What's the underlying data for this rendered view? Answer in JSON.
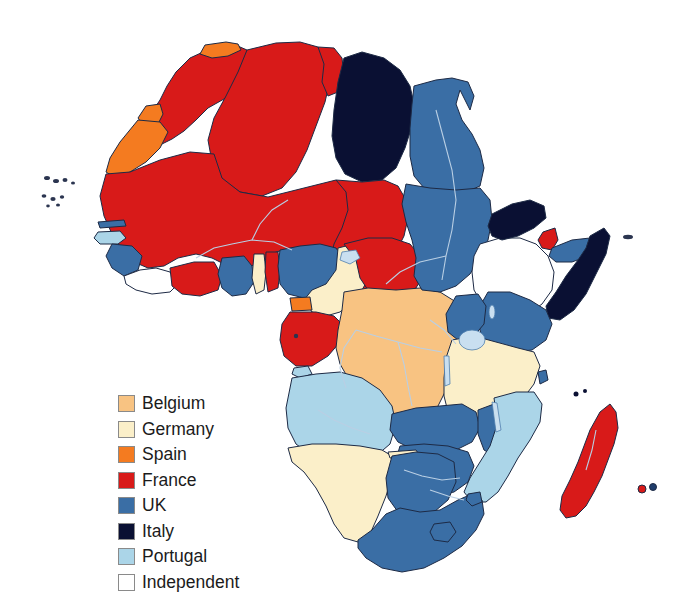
{
  "map": {
    "title": "Colonial Africa",
    "background_color": "#ffffff",
    "border_color": "#1d2a45",
    "river_color": "#b9cfe4",
    "legend": {
      "position": "lower-left",
      "items": [
        {
          "label": "Belgium",
          "color": "#f8c382",
          "swatch_border": "#8a8a8a"
        },
        {
          "label": "Germany",
          "color": "#fbefc9",
          "swatch_border": "#8a8a8a"
        },
        {
          "label": "Spain",
          "color": "#f47b20",
          "swatch_border": "#8a8a8a"
        },
        {
          "label": "France",
          "color": "#d81a19",
          "swatch_border": "#8a8a8a"
        },
        {
          "label": "UK",
          "color": "#3a6ea5",
          "swatch_border": "#8a8a8a"
        },
        {
          "label": "Italy",
          "color": "#0a1033",
          "swatch_border": "#8a8a8a"
        },
        {
          "label": "Portugal",
          "color": "#abd5e8",
          "swatch_border": "#8a8a8a"
        },
        {
          "label": "Independent",
          "color": "#ffffff",
          "swatch_border": "#8a8a8a"
        }
      ]
    },
    "regions": [
      {
        "name": "Morocco",
        "power": "France",
        "color": "#d81a19"
      },
      {
        "name": "Spanish Morocco",
        "power": "Spain",
        "color": "#f47b20"
      },
      {
        "name": "Ifni",
        "power": "Spain",
        "color": "#f47b20"
      },
      {
        "name": "Rio de Oro (Spanish Sahara)",
        "power": "Spain",
        "color": "#f47b20"
      },
      {
        "name": "Algeria",
        "power": "France",
        "color": "#d81a19"
      },
      {
        "name": "Tunisia",
        "power": "France",
        "color": "#d81a19"
      },
      {
        "name": "Libya",
        "power": "Italy",
        "color": "#0a1033"
      },
      {
        "name": "Egypt",
        "power": "UK",
        "color": "#3a6ea5"
      },
      {
        "name": "Anglo-Egyptian Sudan",
        "power": "UK",
        "color": "#3a6ea5"
      },
      {
        "name": "French West Africa",
        "power": "France",
        "color": "#d81a19"
      },
      {
        "name": "Mauritania",
        "power": "France",
        "color": "#d81a19"
      },
      {
        "name": "Senegal",
        "power": "France",
        "color": "#d81a19"
      },
      {
        "name": "Gambia",
        "power": "UK",
        "color": "#3a6ea5"
      },
      {
        "name": "Portuguese Guinea",
        "power": "Portugal",
        "color": "#abd5e8"
      },
      {
        "name": "Sierra Leone",
        "power": "UK",
        "color": "#3a6ea5"
      },
      {
        "name": "Liberia",
        "power": "Independent",
        "color": "#ffffff"
      },
      {
        "name": "Ivory Coast",
        "power": "France",
        "color": "#d81a19"
      },
      {
        "name": "Gold Coast",
        "power": "UK",
        "color": "#3a6ea5"
      },
      {
        "name": "Togoland",
        "power": "Germany",
        "color": "#fbefc9"
      },
      {
        "name": "Dahomey",
        "power": "France",
        "color": "#d81a19"
      },
      {
        "name": "Nigeria",
        "power": "UK",
        "color": "#3a6ea5"
      },
      {
        "name": "Kamerun",
        "power": "Germany",
        "color": "#fbefc9"
      },
      {
        "name": "Rio Muni (Spanish Guinea)",
        "power": "Spain",
        "color": "#f47b20"
      },
      {
        "name": "French Equatorial Africa",
        "power": "France",
        "color": "#d81a19"
      },
      {
        "name": "Gabon",
        "power": "France",
        "color": "#d81a19"
      },
      {
        "name": "Chad",
        "power": "France",
        "color": "#d81a19"
      },
      {
        "name": "Belgian Congo",
        "power": "Belgium",
        "color": "#f8c382"
      },
      {
        "name": "Cabinda",
        "power": "Portugal",
        "color": "#abd5e8"
      },
      {
        "name": "Angola",
        "power": "Portugal",
        "color": "#abd5e8"
      },
      {
        "name": "German South-West Africa",
        "power": "Germany",
        "color": "#fbefc9"
      },
      {
        "name": "Bechuanaland",
        "power": "UK",
        "color": "#3a6ea5"
      },
      {
        "name": "Union of South Africa",
        "power": "UK",
        "color": "#3a6ea5"
      },
      {
        "name": "Basutoland",
        "power": "UK",
        "color": "#3a6ea5"
      },
      {
        "name": "Swaziland",
        "power": "UK",
        "color": "#3a6ea5"
      },
      {
        "name": "Southern Rhodesia",
        "power": "UK",
        "color": "#3a6ea5"
      },
      {
        "name": "Northern Rhodesia",
        "power": "UK",
        "color": "#3a6ea5"
      },
      {
        "name": "Nyasaland",
        "power": "UK",
        "color": "#3a6ea5"
      },
      {
        "name": "Mozambique",
        "power": "Portugal",
        "color": "#abd5e8"
      },
      {
        "name": "German East Africa",
        "power": "Germany",
        "color": "#fbefc9"
      },
      {
        "name": "British East Africa",
        "power": "UK",
        "color": "#3a6ea5"
      },
      {
        "name": "Uganda",
        "power": "UK",
        "color": "#3a6ea5"
      },
      {
        "name": "Abyssinia (Ethiopia)",
        "power": "Independent",
        "color": "#ffffff"
      },
      {
        "name": "Eritrea",
        "power": "Italy",
        "color": "#0a1033"
      },
      {
        "name": "French Somaliland",
        "power": "France",
        "color": "#d81a19"
      },
      {
        "name": "British Somaliland",
        "power": "UK",
        "color": "#3a6ea5"
      },
      {
        "name": "Italian Somaliland",
        "power": "Italy",
        "color": "#0a1033"
      },
      {
        "name": "Madagascar",
        "power": "France",
        "color": "#d81a19"
      },
      {
        "name": "Reunion",
        "power": "France",
        "color": "#d81a19"
      },
      {
        "name": "Mauritius",
        "power": "UK",
        "color": "#3a6ea5"
      },
      {
        "name": "Zanzibar",
        "power": "UK",
        "color": "#3a6ea5"
      },
      {
        "name": "Cape Verde Islands",
        "power": "Portugal",
        "color": "#abd5e8"
      },
      {
        "name": "Canary Islands",
        "power": "Spain",
        "color": "#f47b20"
      }
    ]
  }
}
